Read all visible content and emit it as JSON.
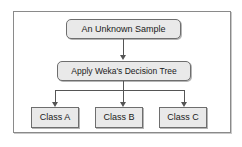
{
  "diagram": {
    "type": "flowchart",
    "nodes": [
      {
        "id": "input",
        "label": "An Unknown Sample",
        "shape": "rounded-rectangle"
      },
      {
        "id": "process",
        "label": "Apply Weka's Decision Tree",
        "shape": "rounded-rectangle"
      },
      {
        "id": "classA",
        "label": "Class A",
        "shape": "rectangle"
      },
      {
        "id": "classB",
        "label": "Class B",
        "shape": "rectangle"
      },
      {
        "id": "classC",
        "label": "Class C",
        "shape": "rectangle"
      }
    ],
    "edges": [
      {
        "from": "input",
        "to": "process",
        "label": ""
      },
      {
        "from": "process",
        "to": "classA",
        "label": ""
      },
      {
        "from": "process",
        "to": "classB",
        "label": ""
      },
      {
        "from": "process",
        "to": "classC",
        "label": ""
      }
    ],
    "colors": {
      "node_fill": "#e9e9e9",
      "node_border": "#6e6e6e",
      "connector": "#555555",
      "frame_border": "#8a8a8a",
      "background": "#ffffff",
      "text": "#1a1a1a"
    }
  }
}
